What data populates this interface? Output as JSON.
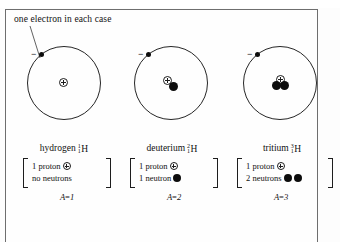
{
  "figure": {
    "top_edge_text": "",
    "caption": "one electron in each case",
    "background_color": "#fefefe",
    "frame_color": "#6e6e6e"
  },
  "atoms": [
    {
      "id": "hydrogen",
      "electron_charge_sign": "−",
      "name": "hydrogen",
      "mass_number": "1",
      "atomic_number": "1",
      "element_symbol": "H",
      "composition": {
        "proton_text": "1 proton",
        "neutron_text": "no neutrons",
        "proton_count": 1,
        "neutron_count": 0
      },
      "mass_label_a": "A",
      "mass_label_eq": "=",
      "mass_label_value": "1"
    },
    {
      "id": "deuterium",
      "electron_charge_sign": "−",
      "name": "deuterium",
      "mass_number": "2",
      "atomic_number": "1",
      "element_symbol": "H",
      "composition": {
        "proton_text": "1 proton",
        "neutron_text": "1 neutron",
        "proton_count": 1,
        "neutron_count": 1
      },
      "mass_label_a": "A",
      "mass_label_eq": "=",
      "mass_label_value": "2"
    },
    {
      "id": "tritium",
      "electron_charge_sign": "−",
      "name": "tritium",
      "mass_number": "3",
      "atomic_number": "1",
      "element_symbol": "H",
      "composition": {
        "proton_text": "1 proton",
        "neutron_text": "2 neutrons",
        "proton_count": 1,
        "neutron_count": 2
      },
      "mass_label_a": "A",
      "mass_label_eq": "=",
      "mass_label_value": "3"
    }
  ],
  "colors": {
    "ink": "#111111",
    "orbit": "#262626",
    "neutron_fill": "#0d0d0d",
    "proton_outline": "#1c1c1c"
  }
}
